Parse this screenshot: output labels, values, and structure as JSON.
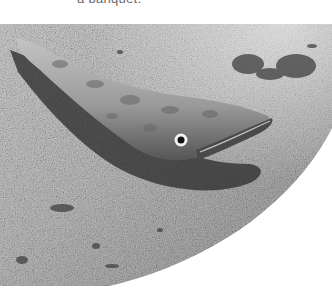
{
  "caption": {
    "text": "a banquet."
  },
  "photo": {
    "subject": "fish-lying-on-sand",
    "style": "grayscale",
    "colors": {
      "sand_light": "#d4d4d4",
      "sand_mid": "#a8a8a8",
      "sand_dark": "#6e6e6e",
      "fish_body": "#8c8c8c",
      "fish_shadow": "#2a2a2a",
      "eye_ring": "#f2f2f2",
      "eye_pupil": "#111111",
      "seaweed": "#3a3a3a",
      "page_bg": "#ffffff"
    }
  }
}
